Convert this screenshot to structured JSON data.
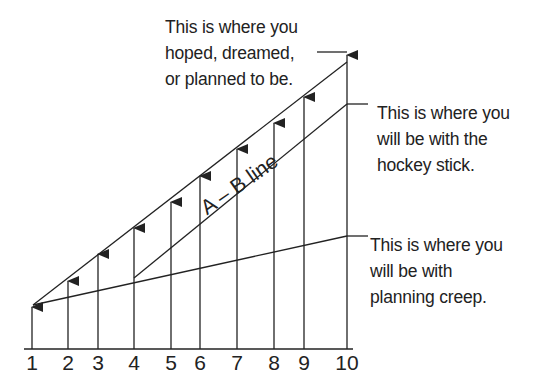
{
  "diagram": {
    "colors": {
      "stroke": "#222222",
      "background": "#ffffff"
    },
    "axis": {
      "y": 349,
      "x_start": 24,
      "x_end": 353,
      "ticks": [
        {
          "label": "1",
          "x": 32,
          "tip": 306
        },
        {
          "label": "2",
          "x": 68,
          "tip": 280
        },
        {
          "label": "3",
          "x": 98,
          "tip": 253
        },
        {
          "label": "4",
          "x": 134,
          "tip": 227
        },
        {
          "label": "5",
          "x": 171,
          "tip": 201
        },
        {
          "label": "6",
          "x": 200,
          "tip": 175
        },
        {
          "label": "7",
          "x": 237,
          "tip": 148
        },
        {
          "label": "8",
          "x": 274,
          "tip": 122
        },
        {
          "label": "9",
          "x": 304,
          "tip": 96
        },
        {
          "label": "10",
          "x": 347,
          "tip": 54
        }
      ]
    },
    "lines": {
      "planned": {
        "x1": 33,
        "y1": 305,
        "x2": 347,
        "y2": 62,
        "leader_x1": 317,
        "leader_y": 52
      },
      "hockey_stick": {
        "x1": 134,
        "y1": 278,
        "x2": 347,
        "y2": 104,
        "leader_x2": 368
      },
      "planning_creep": {
        "x1": 33,
        "y1": 305,
        "x2": 347,
        "y2": 236,
        "leader_x2": 368
      }
    },
    "annotations": {
      "planned": [
        "This is where you",
        "hoped, dreamed,",
        "or planned to be."
      ],
      "hockey_stick": [
        "This is where you",
        "will be with the",
        "hockey stick."
      ],
      "planning_creep": [
        "This is where you",
        "will be with",
        "planning creep."
      ],
      "ab_line": "A – B line"
    }
  }
}
